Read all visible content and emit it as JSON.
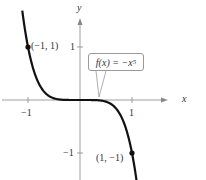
{
  "chart_data": {
    "type": "line",
    "title": "",
    "function": "f(x) = -x^5",
    "xlabel": "x",
    "ylabel": "y",
    "x_ticks": [
      -1,
      1
    ],
    "y_ticks": [
      1,
      -1
    ],
    "xlim": [
      -1.5,
      1.2
    ],
    "ylim": [
      -1.5,
      1.5
    ],
    "grid": false,
    "points": [
      {
        "x": -1,
        "y": 1,
        "label": "(−1, 1)"
      },
      {
        "x": 1,
        "y": -1,
        "label": "(1, −1)"
      }
    ],
    "annotation": "f(x) = −x",
    "annotation_exp": "5",
    "curve_color": "#111111",
    "axis_color": "#888888"
  },
  "labels": {
    "x_axis": "x",
    "y_axis": "y",
    "tick_x_neg1": "−1",
    "tick_x_1": "1",
    "tick_y_1": "1",
    "tick_y_neg1": "−1",
    "point_a": "(−1, 1)",
    "point_b": "(1, −1)",
    "callout_text": "f(x) = −x",
    "callout_exp": "5"
  }
}
